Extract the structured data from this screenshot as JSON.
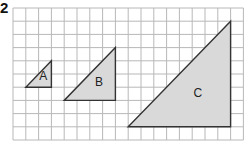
{
  "question_number": "2",
  "grid": {
    "origin_x": 13,
    "origin_y": 8,
    "cols": 18,
    "rows": 10,
    "cell_w": 12.8,
    "cell_h": 13.2,
    "line_color": "#b8b8b8"
  },
  "triangles": [
    {
      "label": "A",
      "left_col": 1,
      "right_col": 3,
      "top_row": 4,
      "bottom_row": 6,
      "fill": "#d9d9d9",
      "stroke": "#333333"
    },
    {
      "label": "B",
      "left_col": 4,
      "right_col": 8,
      "top_row": 3,
      "bottom_row": 7,
      "fill": "#d9d9d9",
      "stroke": "#333333"
    },
    {
      "label": "C",
      "left_col": 9,
      "right_col": 17,
      "top_row": 1,
      "bottom_row": 9,
      "fill": "#d9d9d9",
      "stroke": "#333333"
    }
  ]
}
